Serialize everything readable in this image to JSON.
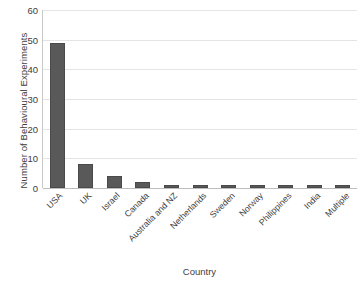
{
  "chart_data": {
    "type": "bar",
    "title": "",
    "xlabel": "Country",
    "ylabel": "Number of Behavioural Experiments",
    "categories": [
      "USA",
      "UK",
      "Israel",
      "Canada",
      "Australia and NZ",
      "Netherlands",
      "Sweden",
      "Norway",
      "Philippines",
      "India",
      "Multiple"
    ],
    "values": [
      49,
      8,
      4,
      2,
      1,
      1,
      1,
      1,
      1,
      1,
      1
    ],
    "ylim": [
      0,
      60
    ],
    "ytick_values": [
      0,
      10,
      20,
      30,
      40,
      50,
      60
    ],
    "ytick_labels": [
      "0",
      "10",
      "20",
      "30",
      "40",
      "50",
      "60"
    ],
    "grid": true,
    "grid_axis": "y",
    "legend": false,
    "orientation": "vertical",
    "colors": {
      "bar": "#595959",
      "bar_border": "#4a4a4a",
      "gridline": "#e4e4e4",
      "axis_line": "#c9c9c9",
      "baseline": "#bdbdbd",
      "text": "#404040",
      "background": "#ffffff"
    }
  }
}
